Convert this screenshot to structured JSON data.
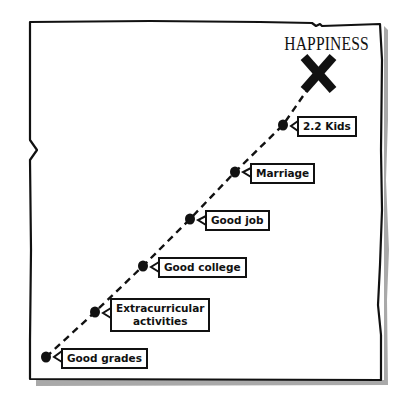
{
  "title": "HAPPINESS",
  "goal_marker": {
    "icon": "x-mark-icon",
    "label": "HAPPINESS"
  },
  "milestones": [
    {
      "label": "Good grades",
      "order": 1
    },
    {
      "label": "Extracurricular activities",
      "line1": "Extracurricular",
      "line2": "activities",
      "order": 2
    },
    {
      "label": "Good college",
      "order": 3
    },
    {
      "label": "Good job",
      "order": 4
    },
    {
      "label": "Marriage",
      "order": 5
    },
    {
      "label": "2.2 Kids",
      "order": 6
    }
  ],
  "colors": {
    "ink": "#111111",
    "paper": "#ffffff",
    "shadow": "#9a9a9a"
  }
}
